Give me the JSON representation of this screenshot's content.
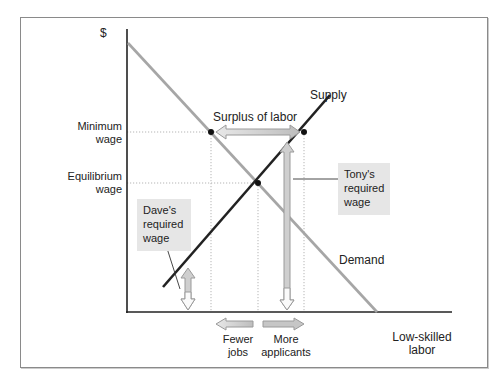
{
  "diagram": {
    "title": "",
    "y_axis_label": "$",
    "x_axis_label": "Low-skilled labor",
    "x_axis_label_lines": [
      "Low-skilled",
      "labor"
    ],
    "y_ticks": {
      "minimum_wage": [
        "Minimum",
        "wage"
      ],
      "equilibrium_wage": [
        "Equilibrium",
        "wage"
      ]
    },
    "curves": {
      "supply": "Supply",
      "demand": "Demand"
    },
    "annotations": {
      "surplus": "Surplus of labor",
      "tony": [
        "Tony's",
        "required",
        "wage"
      ],
      "dave": [
        "Dave's",
        "required",
        "wage"
      ],
      "fewer_jobs": [
        "Fewer",
        "jobs"
      ],
      "more_applicants": [
        "More",
        "applicants"
      ]
    },
    "colors": {
      "supply": "#222222",
      "demand": "#a6a6a6",
      "arrow_fill": "#d9d9d9",
      "arrow_stroke": "#9a9a9a",
      "callout_bg": "#e6e6e6",
      "guide": "#b0b0b0"
    }
  }
}
